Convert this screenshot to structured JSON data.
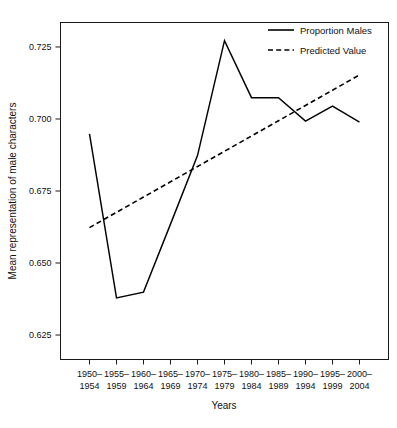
{
  "chart_data": {
    "type": "line",
    "title": "",
    "xlabel": "Years",
    "ylabel": "Mean representation of male characters",
    "categories": [
      "1950–\n1954",
      "1955–\n1959",
      "1960–\n1964",
      "1965–\n1969",
      "1970–\n1974",
      "1975–\n1979",
      "1980–\n1984",
      "1985–\n1989",
      "1990–\n1994",
      "1995–\n1999",
      "2000–\n2004"
    ],
    "category_lines": [
      [
        "1950–",
        "1954"
      ],
      [
        "1955–",
        "1959"
      ],
      [
        "1960–",
        "1964"
      ],
      [
        "1965–",
        "1969"
      ],
      [
        "1970–",
        "1974"
      ],
      [
        "1975–",
        "1979"
      ],
      [
        "1980–",
        "1984"
      ],
      [
        "1985–",
        "1989"
      ],
      [
        "1990–",
        "1994"
      ],
      [
        "1995–",
        "1999"
      ],
      [
        "2000–",
        "2004"
      ]
    ],
    "yticks": [
      0.625,
      0.65,
      0.675,
      0.7,
      0.725
    ],
    "ytick_labels": [
      "0.625",
      "0.650",
      "0.675",
      "0.700",
      "0.725"
    ],
    "ylim": [
      0.6165,
      0.7335
    ],
    "xlim": [
      0,
      10
    ],
    "grid": false,
    "legend_position": "top-right",
    "series": [
      {
        "name": "Proportion Males",
        "style": "solid",
        "color": "#000000",
        "values": [
          0.6948,
          0.6379,
          0.6399,
          0.6635,
          0.6873,
          0.7272,
          0.7074,
          0.7074,
          0.6993,
          0.7045,
          0.6989
        ]
      },
      {
        "name": "Predicted Value",
        "style": "dashed",
        "color": "#000000",
        "values": [
          0.6623,
          0.6676,
          0.6729,
          0.6782,
          0.6835,
          0.6888,
          0.6941,
          0.6994,
          0.7047,
          0.71,
          0.7153
        ]
      }
    ]
  },
  "legend": {
    "items": [
      {
        "label": "Proportion Males",
        "style": "solid"
      },
      {
        "label": "Predicted Value",
        "style": "dashed"
      }
    ]
  },
  "axes": {
    "x_title": "Years",
    "y_title": "Mean representation of male characters"
  }
}
